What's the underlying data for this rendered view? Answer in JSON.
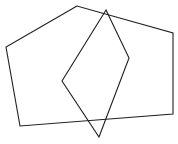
{
  "canvas": {
    "width": 178,
    "height": 144,
    "background_color": "#ffffff",
    "description": "Two overlapping outlined polygons on a plain white background"
  },
  "style": {
    "stroke_color": "#231f20",
    "stroke_width": 1.1,
    "fill": "none"
  },
  "shapes": [
    {
      "name": "pentagon",
      "label": "Pentagon",
      "sides": 5,
      "points": "77,6 6,47 20,126 173,114 173,33",
      "vertices": [
        {
          "x": 77,
          "y": 6
        },
        {
          "x": 6,
          "y": 47
        },
        {
          "x": 20,
          "y": 126
        },
        {
          "x": 173,
          "y": 114
        },
        {
          "x": 173,
          "y": 33
        }
      ]
    },
    {
      "name": "quadrilateral",
      "label": "Quadrilateral",
      "sides": 4,
      "points": "106,10 62,81 99,137 129,58",
      "vertices": [
        {
          "x": 106,
          "y": 10
        },
        {
          "x": 62,
          "y": 81
        },
        {
          "x": 99,
          "y": 137
        },
        {
          "x": 129,
          "y": 58
        }
      ]
    }
  ]
}
